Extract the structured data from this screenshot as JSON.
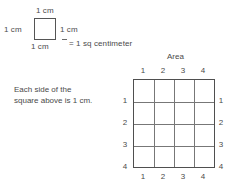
{
  "unit_square": {
    "top_label": "1 cm",
    "left_label": "1 cm",
    "right_label": "1 cm",
    "bottom_label": "1 cm",
    "equals_label": "= 1 sq centimeter"
  },
  "caption": {
    "line1": "Each side of the",
    "line2": "square above is 1 cm."
  },
  "area_grid": {
    "title": "Area",
    "columns": 4,
    "rows": 4,
    "top_labels": [
      "1",
      "2",
      "3",
      "4"
    ],
    "bottom_labels": [
      "1",
      "2",
      "3",
      "4"
    ],
    "left_labels": [
      "1",
      "2",
      "3",
      "4"
    ],
    "right_labels": [
      "1",
      "2",
      "3",
      "4"
    ]
  },
  "colors": {
    "background": "#ffffff",
    "text": "#4a4a4a",
    "square_border": "#555555",
    "grid_border": "#4f4f4f",
    "grid_line": "#777777"
  }
}
